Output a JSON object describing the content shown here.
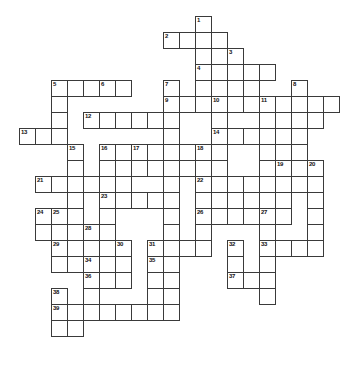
{
  "puzzle": {
    "title": "Crossword Puzzle Grid",
    "type": "blank-crossword-grid",
    "cell_size": 16,
    "origin": {
      "x": 19,
      "y": 16
    },
    "grid_columns": 21,
    "grid_rows": 23,
    "colors": {
      "cell_fill": "#ffffff",
      "cell_border": "#3a3a3a",
      "number_text": "#111111",
      "background": "#ffffff"
    },
    "clue_numbers": [
      1,
      2,
      3,
      4,
      5,
      6,
      7,
      8,
      9,
      10,
      11,
      12,
      13,
      14,
      15,
      16,
      17,
      18,
      19,
      20,
      21,
      22,
      23,
      24,
      25,
      26,
      27,
      28,
      29,
      30,
      31,
      32,
      33,
      34,
      35,
      36,
      37,
      38,
      39
    ],
    "cells": [
      {
        "c": 11,
        "r": 0,
        "n": "1"
      },
      {
        "c": 9,
        "r": 1,
        "n": "2"
      },
      {
        "c": 10,
        "r": 1
      },
      {
        "c": 11,
        "r": 1
      },
      {
        "c": 12,
        "r": 1
      },
      {
        "c": 11,
        "r": 2
      },
      {
        "c": 12,
        "r": 2
      },
      {
        "c": 13,
        "r": 2,
        "n": "3"
      },
      {
        "c": 11,
        "r": 3,
        "n": "4"
      },
      {
        "c": 12,
        "r": 3
      },
      {
        "c": 13,
        "r": 3
      },
      {
        "c": 14,
        "r": 3
      },
      {
        "c": 15,
        "r": 3
      },
      {
        "c": 11,
        "r": 4
      },
      {
        "c": 12,
        "r": 4
      },
      {
        "c": 13,
        "r": 4
      },
      {
        "c": 14,
        "r": 4
      },
      {
        "c": 17,
        "r": 4,
        "n": "8"
      },
      {
        "c": 2,
        "r": 4,
        "n": "5"
      },
      {
        "c": 3,
        "r": 4
      },
      {
        "c": 4,
        "r": 4
      },
      {
        "c": 5,
        "r": 4,
        "n": "6"
      },
      {
        "c": 6,
        "r": 4
      },
      {
        "c": 9,
        "r": 4,
        "n": "7"
      },
      {
        "c": 2,
        "r": 5
      },
      {
        "c": 9,
        "r": 5,
        "n": "9"
      },
      {
        "c": 10,
        "r": 5
      },
      {
        "c": 11,
        "r": 5
      },
      {
        "c": 12,
        "r": 5,
        "n": "10"
      },
      {
        "c": 13,
        "r": 5
      },
      {
        "c": 14,
        "r": 5
      },
      {
        "c": 15,
        "r": 5,
        "n": "11"
      },
      {
        "c": 16,
        "r": 5
      },
      {
        "c": 17,
        "r": 5
      },
      {
        "c": 18,
        "r": 5
      },
      {
        "c": 19,
        "r": 5
      },
      {
        "c": 2,
        "r": 6
      },
      {
        "c": 4,
        "r": 6,
        "n": "12"
      },
      {
        "c": 5,
        "r": 6
      },
      {
        "c": 6,
        "r": 6
      },
      {
        "c": 7,
        "r": 6
      },
      {
        "c": 8,
        "r": 6
      },
      {
        "c": 9,
        "r": 6
      },
      {
        "c": 12,
        "r": 6
      },
      {
        "c": 15,
        "r": 6
      },
      {
        "c": 16,
        "r": 6
      },
      {
        "c": 17,
        "r": 6
      },
      {
        "c": 18,
        "r": 6
      },
      {
        "c": 0,
        "r": 7,
        "n": "13"
      },
      {
        "c": 1,
        "r": 7
      },
      {
        "c": 2,
        "r": 7
      },
      {
        "c": 9,
        "r": 7
      },
      {
        "c": 12,
        "r": 7,
        "n": "14"
      },
      {
        "c": 13,
        "r": 7
      },
      {
        "c": 14,
        "r": 7
      },
      {
        "c": 15,
        "r": 7
      },
      {
        "c": 16,
        "r": 7
      },
      {
        "c": 17,
        "r": 7
      },
      {
        "c": 3,
        "r": 8,
        "n": "15"
      },
      {
        "c": 5,
        "r": 8,
        "n": "16"
      },
      {
        "c": 6,
        "r": 8
      },
      {
        "c": 7,
        "r": 8,
        "n": "17"
      },
      {
        "c": 8,
        "r": 8
      },
      {
        "c": 9,
        "r": 8
      },
      {
        "c": 10,
        "r": 8
      },
      {
        "c": 11,
        "r": 8,
        "n": "18"
      },
      {
        "c": 12,
        "r": 8
      },
      {
        "c": 15,
        "r": 8
      },
      {
        "c": 16,
        "r": 8
      },
      {
        "c": 17,
        "r": 8
      },
      {
        "c": 3,
        "r": 9
      },
      {
        "c": 5,
        "r": 9
      },
      {
        "c": 6,
        "r": 9
      },
      {
        "c": 7,
        "r": 9
      },
      {
        "c": 8,
        "r": 9
      },
      {
        "c": 9,
        "r": 9
      },
      {
        "c": 10,
        "r": 9
      },
      {
        "c": 11,
        "r": 9
      },
      {
        "c": 12,
        "r": 9
      },
      {
        "c": 15,
        "r": 9
      },
      {
        "c": 16,
        "r": 9,
        "n": "19"
      },
      {
        "c": 18,
        "r": 9,
        "n": "20"
      },
      {
        "c": 1,
        "r": 10,
        "n": "21"
      },
      {
        "c": 2,
        "r": 10
      },
      {
        "c": 3,
        "r": 10
      },
      {
        "c": 4,
        "r": 10
      },
      {
        "c": 5,
        "r": 10
      },
      {
        "c": 6,
        "r": 10
      },
      {
        "c": 9,
        "r": 10
      },
      {
        "c": 11,
        "r": 10,
        "n": "22"
      },
      {
        "c": 12,
        "r": 10
      },
      {
        "c": 13,
        "r": 10
      },
      {
        "c": 14,
        "r": 10
      },
      {
        "c": 15,
        "r": 10
      },
      {
        "c": 16,
        "r": 10
      },
      {
        "c": 17,
        "r": 10
      },
      {
        "c": 18,
        "r": 10
      },
      {
        "c": 3,
        "r": 11
      },
      {
        "c": 5,
        "r": 11,
        "n": "23"
      },
      {
        "c": 6,
        "r": 11
      },
      {
        "c": 7,
        "r": 11
      },
      {
        "c": 8,
        "r": 11
      },
      {
        "c": 9,
        "r": 11
      },
      {
        "c": 11,
        "r": 11
      },
      {
        "c": 12,
        "r": 11
      },
      {
        "c": 13,
        "r": 11
      },
      {
        "c": 14,
        "r": 11
      },
      {
        "c": 15,
        "r": 11
      },
      {
        "c": 16,
        "r": 11
      },
      {
        "c": 18,
        "r": 11
      },
      {
        "c": 1,
        "r": 12,
        "n": "24"
      },
      {
        "c": 2,
        "r": 12,
        "n": "25"
      },
      {
        "c": 3,
        "r": 12
      },
      {
        "c": 5,
        "r": 12
      },
      {
        "c": 9,
        "r": 12
      },
      {
        "c": 11,
        "r": 12,
        "n": "26"
      },
      {
        "c": 12,
        "r": 12
      },
      {
        "c": 13,
        "r": 12
      },
      {
        "c": 14,
        "r": 12
      },
      {
        "c": 15,
        "r": 12,
        "n": "27"
      },
      {
        "c": 16,
        "r": 12
      },
      {
        "c": 18,
        "r": 12
      },
      {
        "c": 1,
        "r": 13
      },
      {
        "c": 2,
        "r": 13
      },
      {
        "c": 3,
        "r": 13
      },
      {
        "c": 4,
        "r": 13,
        "n": "28"
      },
      {
        "c": 5,
        "r": 13
      },
      {
        "c": 9,
        "r": 13
      },
      {
        "c": 11,
        "r": 13
      },
      {
        "c": 15,
        "r": 13
      },
      {
        "c": 18,
        "r": 13
      },
      {
        "c": 2,
        "r": 14,
        "n": "29"
      },
      {
        "c": 3,
        "r": 14
      },
      {
        "c": 4,
        "r": 14
      },
      {
        "c": 5,
        "r": 14
      },
      {
        "c": 6,
        "r": 14,
        "n": "30"
      },
      {
        "c": 8,
        "r": 14,
        "n": "31"
      },
      {
        "c": 9,
        "r": 14
      },
      {
        "c": 10,
        "r": 14
      },
      {
        "c": 11,
        "r": 14
      },
      {
        "c": 13,
        "r": 14,
        "n": "32"
      },
      {
        "c": 15,
        "r": 14,
        "n": "33"
      },
      {
        "c": 16,
        "r": 14
      },
      {
        "c": 17,
        "r": 14
      },
      {
        "c": 18,
        "r": 14
      },
      {
        "c": 2,
        "r": 15
      },
      {
        "c": 3,
        "r": 15
      },
      {
        "c": 4,
        "r": 15,
        "n": "34"
      },
      {
        "c": 5,
        "r": 15
      },
      {
        "c": 6,
        "r": 15
      },
      {
        "c": 8,
        "r": 15,
        "n": "35"
      },
      {
        "c": 9,
        "r": 15
      },
      {
        "c": 13,
        "r": 15
      },
      {
        "c": 15,
        "r": 15
      },
      {
        "c": 4,
        "r": 16,
        "n": "36"
      },
      {
        "c": 5,
        "r": 16
      },
      {
        "c": 6,
        "r": 16
      },
      {
        "c": 8,
        "r": 16
      },
      {
        "c": 9,
        "r": 16
      },
      {
        "c": 13,
        "r": 16,
        "n": "37"
      },
      {
        "c": 14,
        "r": 16
      },
      {
        "c": 15,
        "r": 16
      },
      {
        "c": 2,
        "r": 17,
        "n": "38"
      },
      {
        "c": 4,
        "r": 17
      },
      {
        "c": 8,
        "r": 17
      },
      {
        "c": 9,
        "r": 17
      },
      {
        "c": 15,
        "r": 17
      },
      {
        "c": 2,
        "r": 18,
        "n": "39"
      },
      {
        "c": 3,
        "r": 18
      },
      {
        "c": 4,
        "r": 18
      },
      {
        "c": 5,
        "r": 18
      },
      {
        "c": 6,
        "r": 18
      },
      {
        "c": 7,
        "r": 18
      },
      {
        "c": 8,
        "r": 18
      },
      {
        "c": 9,
        "r": 18
      },
      {
        "c": 2,
        "r": 19
      },
      {
        "c": 3,
        "r": 19
      }
    ]
  }
}
